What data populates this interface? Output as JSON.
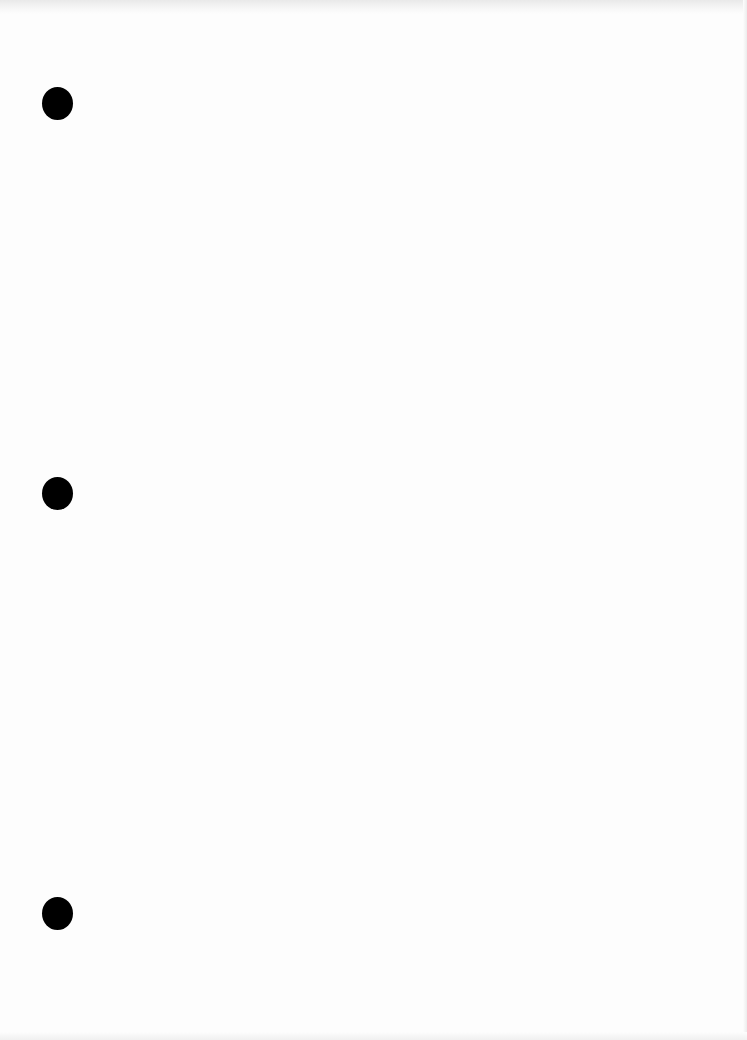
{
  "document": {
    "type": "blank scanned page",
    "text_content": "",
    "punch_holes": [
      {
        "x": 57,
        "y": 103
      },
      {
        "x": 57,
        "y": 493
      },
      {
        "x": 57,
        "y": 913
      }
    ],
    "colors": {
      "paper": "#fdfdfd",
      "hole": "#000000"
    }
  }
}
